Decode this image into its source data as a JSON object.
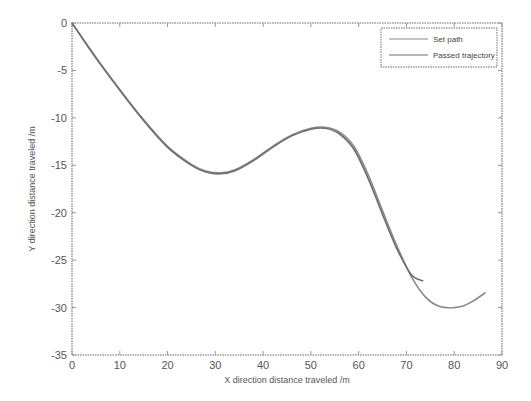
{
  "chart_data": {
    "type": "line",
    "title": "",
    "xlabel": "X direction distance traveled /m",
    "ylabel": "Y direction distance traveled /m",
    "xlim": [
      0,
      90
    ],
    "ylim": [
      -35,
      0
    ],
    "xticks": [
      0,
      10,
      20,
      30,
      40,
      50,
      60,
      70,
      80,
      90
    ],
    "yticks": [
      0,
      -5,
      -10,
      -15,
      -20,
      -25,
      -30,
      -35
    ],
    "grid": false,
    "legend_position": "upper right",
    "series": [
      {
        "name": "Set path",
        "color": "#8a8a8a",
        "x": [
          0,
          5,
          10,
          15,
          20,
          25,
          28,
          31,
          34,
          38,
          42,
          46,
          50,
          53,
          56,
          59,
          62,
          65,
          68,
          71,
          74,
          77,
          80,
          82,
          84,
          86.6
        ],
        "y": [
          0,
          -3.6,
          -7.0,
          -10.2,
          -13.0,
          -14.9,
          -15.6,
          -15.8,
          -15.5,
          -14.4,
          -13.0,
          -11.8,
          -11.1,
          -11.0,
          -11.5,
          -13.0,
          -16.0,
          -19.8,
          -23.5,
          -26.7,
          -28.9,
          -29.9,
          -30.0,
          -29.8,
          -29.3,
          -28.4
        ]
      },
      {
        "name": "Passed trajectory",
        "color": "#6f6f6f",
        "x": [
          0,
          5,
          10,
          15,
          20,
          25,
          28,
          31,
          34,
          38,
          42,
          46,
          50,
          53,
          56,
          59,
          62,
          65,
          68,
          71,
          73.5
        ],
        "y": [
          0,
          -3.7,
          -7.1,
          -10.3,
          -13.1,
          -15.0,
          -15.7,
          -15.9,
          -15.6,
          -14.5,
          -13.1,
          -11.9,
          -11.2,
          -11.1,
          -11.7,
          -13.3,
          -16.4,
          -20.2,
          -23.8,
          -26.5,
          -27.2
        ]
      }
    ]
  },
  "legend": {
    "items": [
      "Set path",
      "Passed trajectory"
    ]
  },
  "axes": {
    "xlabel": "X direction distance traveled /m",
    "ylabel": "Y direction distance traveled /m"
  }
}
